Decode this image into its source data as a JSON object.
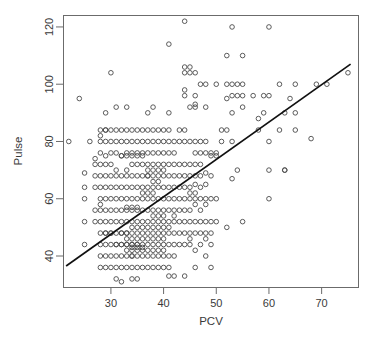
{
  "chart_data": {
    "type": "scatter",
    "title": "",
    "xlabel": "PCV",
    "ylabel": "Pulse",
    "xlim": [
      21,
      77
    ],
    "ylim": [
      29,
      124
    ],
    "grid": false,
    "legend": "none",
    "x_ticks": [
      30,
      40,
      50,
      60,
      70
    ],
    "y_ticks": [
      40,
      60,
      80,
      100,
      120
    ],
    "x_tick_labels": [
      "30",
      "40",
      "50",
      "60",
      "70"
    ],
    "y_tick_labels": [
      "40",
      "60",
      "80",
      "100",
      "120"
    ],
    "marker": "open-circle",
    "marker_color": "#4a4a4a",
    "fit_line": {
      "type": "linear-regression",
      "color": "#111111",
      "x_start": 21.5,
      "y_start": 36.5,
      "x_end": 75.5,
      "y_end": 107.0,
      "slope": 1.305,
      "intercept": 8.4
    },
    "points": [
      [
        22,
        80
      ],
      [
        24,
        95
      ],
      [
        25,
        69
      ],
      [
        25,
        64
      ],
      [
        25,
        60
      ],
      [
        25,
        52
      ],
      [
        25,
        44
      ],
      [
        26,
        80
      ],
      [
        27,
        74
      ],
      [
        27,
        72
      ],
      [
        27,
        68
      ],
      [
        27,
        64
      ],
      [
        27,
        56
      ],
      [
        27,
        52
      ],
      [
        28,
        84
      ],
      [
        28,
        82
      ],
      [
        28,
        80
      ],
      [
        28,
        76
      ],
      [
        28,
        72
      ],
      [
        28,
        68
      ],
      [
        28,
        64
      ],
      [
        28,
        60
      ],
      [
        28,
        58
      ],
      [
        28,
        56
      ],
      [
        28,
        52
      ],
      [
        28,
        48
      ],
      [
        28,
        44
      ],
      [
        28,
        40
      ],
      [
        28,
        36
      ],
      [
        29,
        90
      ],
      [
        29,
        84
      ],
      [
        29,
        84
      ],
      [
        29,
        80
      ],
      [
        29,
        75
      ],
      [
        29,
        72
      ],
      [
        29,
        68
      ],
      [
        29,
        64
      ],
      [
        29,
        60
      ],
      [
        29,
        56
      ],
      [
        29,
        52
      ],
      [
        29,
        48
      ],
      [
        29,
        48
      ],
      [
        29,
        44
      ],
      [
        29,
        40
      ],
      [
        29,
        36
      ],
      [
        30,
        104
      ],
      [
        30,
        84
      ],
      [
        30,
        80
      ],
      [
        30,
        76
      ],
      [
        30,
        72
      ],
      [
        30,
        68
      ],
      [
        30,
        64
      ],
      [
        30,
        60
      ],
      [
        30,
        56
      ],
      [
        30,
        52
      ],
      [
        30,
        48
      ],
      [
        30,
        48
      ],
      [
        30,
        44
      ],
      [
        30,
        40
      ],
      [
        30,
        36
      ],
      [
        31,
        92
      ],
      [
        31,
        84
      ],
      [
        31,
        80
      ],
      [
        31,
        76
      ],
      [
        31,
        70
      ],
      [
        31,
        68
      ],
      [
        31,
        64
      ],
      [
        31,
        60
      ],
      [
        31,
        56
      ],
      [
        31,
        52
      ],
      [
        31,
        48
      ],
      [
        31,
        44
      ],
      [
        31,
        44
      ],
      [
        31,
        40
      ],
      [
        31,
        36
      ],
      [
        31,
        32
      ],
      [
        32,
        84
      ],
      [
        32,
        80
      ],
      [
        32,
        75
      ],
      [
        32,
        75
      ],
      [
        32,
        68
      ],
      [
        32,
        64
      ],
      [
        32,
        60
      ],
      [
        32,
        56
      ],
      [
        32,
        52
      ],
      [
        32,
        48
      ],
      [
        32,
        48
      ],
      [
        32,
        44
      ],
      [
        32,
        44
      ],
      [
        32,
        40
      ],
      [
        32,
        36
      ],
      [
        32,
        31
      ],
      [
        33,
        92
      ],
      [
        33,
        84
      ],
      [
        33,
        80
      ],
      [
        33,
        76
      ],
      [
        33,
        75
      ],
      [
        33,
        70
      ],
      [
        33,
        68
      ],
      [
        33,
        64
      ],
      [
        33,
        60
      ],
      [
        33,
        57
      ],
      [
        33,
        56
      ],
      [
        33,
        52
      ],
      [
        33,
        48
      ],
      [
        33,
        48
      ],
      [
        33,
        46
      ],
      [
        33,
        44
      ],
      [
        33,
        44
      ],
      [
        33,
        42
      ],
      [
        33,
        40
      ],
      [
        33,
        36
      ],
      [
        34,
        84
      ],
      [
        34,
        80
      ],
      [
        34,
        76
      ],
      [
        34,
        75
      ],
      [
        34,
        72
      ],
      [
        34,
        68
      ],
      [
        34,
        64
      ],
      [
        34,
        60
      ],
      [
        34,
        57
      ],
      [
        34,
        56
      ],
      [
        34,
        52
      ],
      [
        34,
        50
      ],
      [
        34,
        48
      ],
      [
        34,
        46
      ],
      [
        34,
        44
      ],
      [
        34,
        44
      ],
      [
        34,
        43
      ],
      [
        34,
        42
      ],
      [
        34,
        40
      ],
      [
        34,
        40
      ],
      [
        34,
        36
      ],
      [
        34,
        32
      ],
      [
        35,
        84
      ],
      [
        35,
        80
      ],
      [
        35,
        76
      ],
      [
        35,
        75
      ],
      [
        35,
        72
      ],
      [
        35,
        68
      ],
      [
        35,
        64
      ],
      [
        35,
        60
      ],
      [
        35,
        57
      ],
      [
        35,
        56
      ],
      [
        35,
        52
      ],
      [
        35,
        50
      ],
      [
        35,
        48
      ],
      [
        35,
        46
      ],
      [
        35,
        44
      ],
      [
        35,
        44
      ],
      [
        35,
        43
      ],
      [
        35,
        42
      ],
      [
        35,
        40
      ],
      [
        35,
        36
      ],
      [
        35,
        32
      ],
      [
        36,
        84
      ],
      [
        36,
        80
      ],
      [
        36,
        76
      ],
      [
        36,
        75
      ],
      [
        36,
        72
      ],
      [
        36,
        68
      ],
      [
        36,
        64
      ],
      [
        36,
        62
      ],
      [
        36,
        60
      ],
      [
        36,
        56
      ],
      [
        36,
        52
      ],
      [
        36,
        50
      ],
      [
        36,
        48
      ],
      [
        36,
        46
      ],
      [
        36,
        44
      ],
      [
        36,
        43
      ],
      [
        36,
        42
      ],
      [
        36,
        40
      ],
      [
        36,
        36
      ],
      [
        37,
        90
      ],
      [
        37,
        84
      ],
      [
        37,
        80
      ],
      [
        37,
        76
      ],
      [
        37,
        72
      ],
      [
        37,
        70
      ],
      [
        37,
        68
      ],
      [
        37,
        68
      ],
      [
        37,
        64
      ],
      [
        37,
        62
      ],
      [
        37,
        60
      ],
      [
        37,
        56
      ],
      [
        37,
        52
      ],
      [
        37,
        50
      ],
      [
        37,
        48
      ],
      [
        37,
        46
      ],
      [
        37,
        44
      ],
      [
        37,
        42
      ],
      [
        37,
        40
      ],
      [
        37,
        36
      ],
      [
        38,
        92
      ],
      [
        38,
        84
      ],
      [
        38,
        80
      ],
      [
        38,
        76
      ],
      [
        38,
        72
      ],
      [
        38,
        70
      ],
      [
        38,
        68
      ],
      [
        38,
        66
      ],
      [
        38,
        64
      ],
      [
        38,
        62
      ],
      [
        38,
        60
      ],
      [
        38,
        56
      ],
      [
        38,
        54
      ],
      [
        38,
        52
      ],
      [
        38,
        50
      ],
      [
        38,
        48
      ],
      [
        38,
        46
      ],
      [
        38,
        44
      ],
      [
        38,
        42
      ],
      [
        38,
        40
      ],
      [
        38,
        36
      ],
      [
        39,
        84
      ],
      [
        39,
        80
      ],
      [
        39,
        76
      ],
      [
        39,
        72
      ],
      [
        39,
        70
      ],
      [
        39,
        68
      ],
      [
        39,
        66
      ],
      [
        39,
        64
      ],
      [
        39,
        60
      ],
      [
        39,
        56
      ],
      [
        39,
        54
      ],
      [
        39,
        52
      ],
      [
        39,
        50
      ],
      [
        39,
        48
      ],
      [
        39,
        46
      ],
      [
        39,
        44
      ],
      [
        39,
        42
      ],
      [
        39,
        40
      ],
      [
        39,
        36
      ],
      [
        40,
        84
      ],
      [
        40,
        80
      ],
      [
        40,
        76
      ],
      [
        40,
        72
      ],
      [
        40,
        70
      ],
      [
        40,
        68
      ],
      [
        40,
        64
      ],
      [
        40,
        60
      ],
      [
        40,
        56
      ],
      [
        40,
        54
      ],
      [
        40,
        52
      ],
      [
        40,
        50
      ],
      [
        40,
        48
      ],
      [
        40,
        46
      ],
      [
        40,
        44
      ],
      [
        40,
        42
      ],
      [
        40,
        40
      ],
      [
        40,
        36
      ],
      [
        41,
        114
      ],
      [
        41,
        90
      ],
      [
        41,
        84
      ],
      [
        41,
        80
      ],
      [
        41,
        76
      ],
      [
        41,
        72
      ],
      [
        41,
        68
      ],
      [
        41,
        64
      ],
      [
        41,
        60
      ],
      [
        41,
        56
      ],
      [
        41,
        52
      ],
      [
        41,
        50
      ],
      [
        41,
        48
      ],
      [
        41,
        44
      ],
      [
        41,
        40
      ],
      [
        41,
        36
      ],
      [
        41,
        33
      ],
      [
        42,
        80
      ],
      [
        42,
        76
      ],
      [
        42,
        72
      ],
      [
        42,
        68
      ],
      [
        42,
        64
      ],
      [
        42,
        60
      ],
      [
        42,
        56
      ],
      [
        42,
        54
      ],
      [
        42,
        52
      ],
      [
        42,
        48
      ],
      [
        42,
        44
      ],
      [
        42,
        40
      ],
      [
        42,
        33
      ],
      [
        43,
        84
      ],
      [
        43,
        80
      ],
      [
        43,
        72
      ],
      [
        43,
        68
      ],
      [
        43,
        64
      ],
      [
        43,
        60
      ],
      [
        43,
        56
      ],
      [
        43,
        52
      ],
      [
        43,
        48
      ],
      [
        43,
        44
      ],
      [
        44,
        122
      ],
      [
        44,
        106
      ],
      [
        44,
        104
      ],
      [
        44,
        98
      ],
      [
        44,
        96
      ],
      [
        44,
        84
      ],
      [
        44,
        80
      ],
      [
        44,
        72
      ],
      [
        44,
        68
      ],
      [
        44,
        64
      ],
      [
        44,
        60
      ],
      [
        44,
        56
      ],
      [
        44,
        52
      ],
      [
        44,
        48
      ],
      [
        44,
        44
      ],
      [
        44,
        33
      ],
      [
        45,
        106
      ],
      [
        45,
        104
      ],
      [
        45,
        92
      ],
      [
        45,
        80
      ],
      [
        45,
        72
      ],
      [
        45,
        68
      ],
      [
        45,
        64
      ],
      [
        45,
        62
      ],
      [
        45,
        60
      ],
      [
        45,
        56
      ],
      [
        45,
        52
      ],
      [
        45,
        48
      ],
      [
        45,
        46
      ],
      [
        45,
        44
      ],
      [
        46,
        104
      ],
      [
        46,
        96
      ],
      [
        46,
        93
      ],
      [
        46,
        92
      ],
      [
        46,
        80
      ],
      [
        46,
        76
      ],
      [
        46,
        72
      ],
      [
        46,
        68
      ],
      [
        46,
        65
      ],
      [
        46,
        62
      ],
      [
        46,
        60
      ],
      [
        46,
        58
      ],
      [
        46,
        52
      ],
      [
        46,
        48
      ],
      [
        46,
        42
      ],
      [
        46,
        36
      ],
      [
        47,
        100
      ],
      [
        47,
        80
      ],
      [
        47,
        76
      ],
      [
        47,
        72
      ],
      [
        47,
        68
      ],
      [
        47,
        64
      ],
      [
        47,
        60
      ],
      [
        47,
        56
      ],
      [
        47,
        52
      ],
      [
        47,
        48
      ],
      [
        47,
        44
      ],
      [
        48,
        100
      ],
      [
        48,
        92
      ],
      [
        48,
        80
      ],
      [
        48,
        76
      ],
      [
        48,
        69
      ],
      [
        48,
        65
      ],
      [
        48,
        60
      ],
      [
        48,
        58
      ],
      [
        48,
        52
      ],
      [
        48,
        48
      ],
      [
        48,
        46
      ],
      [
        48,
        40
      ],
      [
        49,
        76
      ],
      [
        49,
        75
      ],
      [
        49,
        68
      ],
      [
        49,
        60
      ],
      [
        49,
        52
      ],
      [
        49,
        48
      ],
      [
        49,
        44
      ],
      [
        49,
        36
      ],
      [
        50,
        100
      ],
      [
        50,
        76
      ],
      [
        50,
        75
      ],
      [
        50,
        60
      ],
      [
        50,
        52
      ],
      [
        51,
        84
      ],
      [
        51,
        80
      ],
      [
        52,
        110
      ],
      [
        52,
        100
      ],
      [
        52,
        95
      ],
      [
        52,
        84
      ],
      [
        52,
        50
      ],
      [
        53,
        120
      ],
      [
        53,
        100
      ],
      [
        53,
        96
      ],
      [
        53,
        90
      ],
      [
        53,
        80
      ],
      [
        53,
        67
      ],
      [
        54,
        100
      ],
      [
        54,
        96
      ],
      [
        54,
        70
      ],
      [
        55,
        110
      ],
      [
        55,
        100
      ],
      [
        55,
        96
      ],
      [
        55,
        92
      ],
      [
        55,
        52
      ],
      [
        57,
        96
      ],
      [
        58,
        88
      ],
      [
        58,
        84
      ],
      [
        59,
        96
      ],
      [
        59,
        90
      ],
      [
        60,
        120
      ],
      [
        60,
        96
      ],
      [
        60,
        80
      ],
      [
        60,
        70
      ],
      [
        60,
        60
      ],
      [
        62,
        100
      ],
      [
        62,
        84
      ],
      [
        63,
        90
      ],
      [
        63,
        70
      ],
      [
        63,
        70
      ],
      [
        64,
        95
      ],
      [
        65,
        100
      ],
      [
        65,
        90
      ],
      [
        65,
        84
      ],
      [
        68,
        81
      ],
      [
        69,
        100
      ],
      [
        71,
        100
      ],
      [
        75,
        104
      ]
    ]
  }
}
